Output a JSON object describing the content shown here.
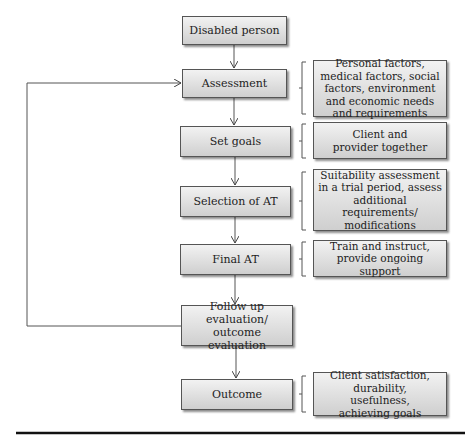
{
  "steps": [
    {
      "id": "disabled-person",
      "label": "Disabled person"
    },
    {
      "id": "assessment",
      "label": "Assessment"
    },
    {
      "id": "set-goals",
      "label": "Set goals"
    },
    {
      "id": "selection-of-at",
      "label": "Selection of AT"
    },
    {
      "id": "final-at",
      "label": "Final AT"
    },
    {
      "id": "follow-up",
      "label": "Follow up evaluation/ outcome evaluation"
    },
    {
      "id": "outcome",
      "label": "Outcome"
    }
  ],
  "notes": {
    "assessment": "Personal factors, medical factors, social factors, environment and economic needs and requirements",
    "set_goals": "Client and provider together",
    "selection_of_at": "Suitability assessment in a trial period, assess additional requirements/ modifications",
    "final_at": "Train and instruct, provide ongoing support",
    "outcome": "Client satisfaction, durability, usefulness, achieving goals"
  },
  "edges": [
    [
      "disabled-person",
      "assessment"
    ],
    [
      "assessment",
      "set-goals"
    ],
    [
      "set-goals",
      "selection-of-at"
    ],
    [
      "selection-of-at",
      "final-at"
    ],
    [
      "final-at",
      "follow-up"
    ],
    [
      "follow-up",
      "outcome"
    ],
    [
      "follow-up",
      "assessment"
    ]
  ]
}
